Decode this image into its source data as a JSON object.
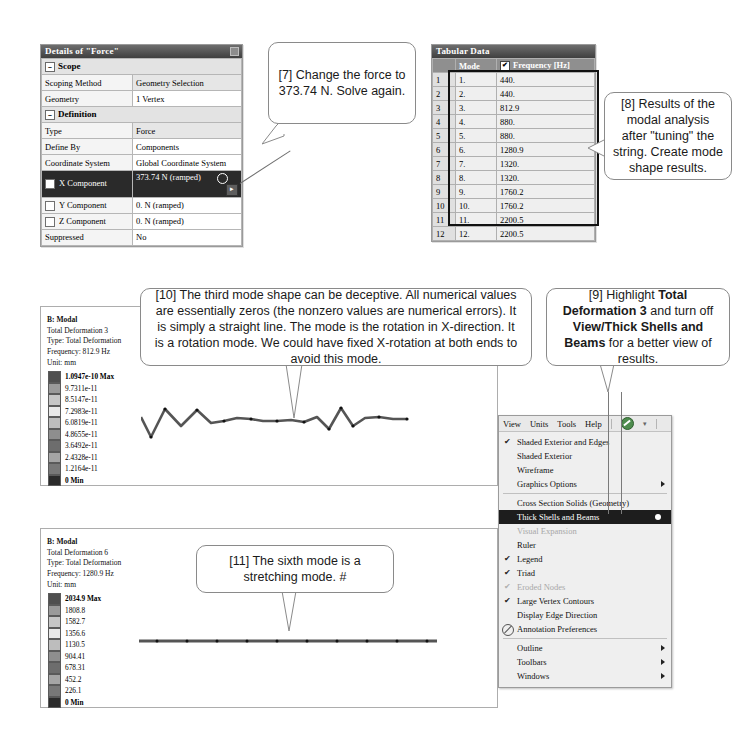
{
  "details_panel": {
    "title": "Details of \"Force\"",
    "rows": [
      {
        "type": "group",
        "label": "Scope"
      },
      {
        "type": "row",
        "label": "Scoping Method",
        "value": "Geometry Selection",
        "shaded": true
      },
      {
        "type": "row",
        "label": "Geometry",
        "value": "1 Vertex",
        "shaded": false
      },
      {
        "type": "group",
        "label": "Definition"
      },
      {
        "type": "row",
        "label": "Type",
        "value": "Force",
        "shaded": true
      },
      {
        "type": "row",
        "label": "Define By",
        "value": "Components",
        "shaded": false
      },
      {
        "type": "row",
        "label": "Coordinate System",
        "value": "Global Coordinate System",
        "shaded": false
      },
      {
        "type": "selected",
        "label": "X Component",
        "value": "373.74 N (ramped)"
      },
      {
        "type": "check",
        "label": "Y Component",
        "value": "0. N (ramped)"
      },
      {
        "type": "check",
        "label": "Z Component",
        "value": "0. N (ramped)"
      },
      {
        "type": "row",
        "label": "Suppressed",
        "value": "No",
        "shaded": false
      }
    ]
  },
  "tabular_panel": {
    "title": "Tabular Data",
    "headers": [
      "",
      "Mode",
      "Frequency [Hz]"
    ],
    "header_checkbox": "✔",
    "rows": [
      {
        "n": "1",
        "mode": "1.",
        "freq": "440."
      },
      {
        "n": "2",
        "mode": "2.",
        "freq": "440."
      },
      {
        "n": "3",
        "mode": "3.",
        "freq": "812.9"
      },
      {
        "n": "4",
        "mode": "4.",
        "freq": "880."
      },
      {
        "n": "5",
        "mode": "5.",
        "freq": "880."
      },
      {
        "n": "6",
        "mode": "6.",
        "freq": "1280.9"
      },
      {
        "n": "7",
        "mode": "7.",
        "freq": "1320."
      },
      {
        "n": "8",
        "mode": "8.",
        "freq": "1320."
      },
      {
        "n": "9",
        "mode": "9.",
        "freq": "1760.2"
      },
      {
        "n": "10",
        "mode": "10.",
        "freq": "1760.2"
      },
      {
        "n": "11",
        "mode": "11.",
        "freq": "2200.5"
      },
      {
        "n": "12",
        "mode": "12.",
        "freq": "2200.5"
      }
    ]
  },
  "result_mode3": {
    "line1": "B: Modal",
    "line2": "Total Deformation 3",
    "line3": "Type: Total Deformation",
    "line4": "Frequency: 812.9 Hz",
    "line5": "Unit: mm",
    "legend": [
      "1.0947e-10 Max",
      "9.7311e-11",
      "8.5147e-11",
      "7.2983e-11",
      "6.0819e-11",
      "4.8655e-11",
      "3.6492e-11",
      "2.4328e-11",
      "1.2164e-11",
      "0 Min"
    ]
  },
  "result_mode6": {
    "line1": "B: Modal",
    "line2": "Total Deformation 6",
    "line3": "Type: Total Deformation",
    "line4": "Frequency: 1280.9 Hz",
    "line5": "Unit: mm",
    "legend": [
      "2034.9 Max",
      "1808.8",
      "1582.7",
      "1356.6",
      "1130.5",
      "904.41",
      "678.31",
      "452.2",
      "226.1",
      "0 Min"
    ]
  },
  "view_menu": {
    "menubar": [
      "View",
      "Units",
      "Tools",
      "Help"
    ],
    "items": [
      {
        "label": "Shaded Exterior and Edges",
        "check": "✔",
        "state": "normal"
      },
      {
        "label": "Shaded Exterior",
        "check": "",
        "state": "normal"
      },
      {
        "label": "Wireframe",
        "check": "",
        "state": "normal"
      },
      {
        "label": "Graphics Options",
        "check": "",
        "state": "normal",
        "arrow": true
      },
      {
        "type": "separator"
      },
      {
        "label": "Cross Section Solids (Geometry)",
        "check": "",
        "state": "normal"
      },
      {
        "label": "Thick Shells and Beams",
        "check": "",
        "state": "highlight",
        "dot": true
      },
      {
        "label": "Visual Expansion",
        "check": "",
        "state": "disabled"
      },
      {
        "label": "Ruler",
        "check": "",
        "state": "normal"
      },
      {
        "label": "Legend",
        "check": "✔",
        "state": "normal"
      },
      {
        "label": "Triad",
        "check": "✔",
        "state": "normal"
      },
      {
        "label": "Eroded Nodes",
        "check": "✔",
        "state": "disabled"
      },
      {
        "label": "Large Vertex Contours",
        "check": "✔",
        "state": "normal"
      },
      {
        "label": "Display Edge Direction",
        "check": "",
        "state": "normal"
      },
      {
        "label": "Annotation Preferences",
        "check": "",
        "state": "normal",
        "icon": "annotation-icon"
      },
      {
        "type": "separator"
      },
      {
        "label": "Outline",
        "check": "",
        "state": "normal",
        "arrow": true
      },
      {
        "label": "Toolbars",
        "check": "",
        "state": "normal",
        "arrow": true
      },
      {
        "label": "Windows",
        "check": "",
        "state": "normal",
        "arrow": true
      }
    ]
  },
  "callouts": {
    "c7": "[7] Change the force to 373.74 N. Solve again.",
    "c8": "[8] Results of the modal analysis after \"tuning\" the string. Create mode shape results.",
    "c9_parts": [
      "[9] Highlight ",
      "Total Deformation 3",
      " and turn off ",
      "View/Thick Shells and Beams",
      " for a better view of results."
    ],
    "c10": "[10] The third mode shape can be deceptive. All numerical values are essentially zeros (the nonzero values are numerical errors).  It is simply a straight line. The mode is the rotation in X-direction.  It is a rotation mode. We could have fixed X-rotation at both ends to avoid this mode.",
    "c11": "[11] The sixth mode is a stretching mode. #"
  }
}
